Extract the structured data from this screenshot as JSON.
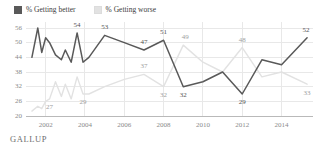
{
  "legend": {
    "items": [
      {
        "label": "% Getting better",
        "color": "#595959",
        "key": "better"
      },
      {
        "label": "% Getting worse",
        "color": "#e2e2e2",
        "key": "worse"
      }
    ]
  },
  "footer": {
    "brand": "GALLUP"
  },
  "chart_data": {
    "type": "line",
    "title": "",
    "xlabel": "",
    "ylabel": "",
    "ylim": [
      20,
      56
    ],
    "xlim": [
      2001.0,
      2015.6
    ],
    "grid": true,
    "legend_position": "top-left",
    "yticks": [
      56,
      50,
      44,
      38,
      32,
      26,
      20
    ],
    "xticks": [
      2002,
      2004,
      2006,
      2008,
      2010,
      2012,
      2014
    ],
    "series": [
      {
        "name": "% Getting better",
        "color": "#595959",
        "x": [
          2001.3,
          2001.6,
          2001.8,
          2002.0,
          2002.2,
          2002.5,
          2002.8,
          2003.0,
          2003.3,
          2003.6,
          2003.9,
          2004.2,
          2005.0,
          2006.0,
          2007.0,
          2008.0,
          2009.0,
          2010.0,
          2011.0,
          2012.0,
          2013.0,
          2014.0,
          2015.3
        ],
        "values": [
          44,
          56,
          46,
          52,
          50,
          45,
          43,
          47,
          42,
          54,
          42,
          44,
          53,
          50,
          47,
          51,
          32,
          34,
          38,
          29,
          43,
          41,
          52
        ]
      },
      {
        "name": "% Getting worse",
        "color": "#e2e2e2",
        "x": [
          2001.3,
          2001.6,
          2001.8,
          2002.0,
          2002.2,
          2002.5,
          2002.8,
          2003.0,
          2003.3,
          2003.6,
          2003.9,
          2004.2,
          2005.0,
          2006.0,
          2007.0,
          2008.0,
          2009.0,
          2010.0,
          2011.0,
          2012.0,
          2013.0,
          2014.0,
          2015.3
        ],
        "values": [
          22,
          24,
          23,
          26,
          27,
          34,
          28,
          33,
          27,
          36,
          29,
          29,
          32,
          35,
          37,
          32,
          49,
          42,
          38,
          48,
          36,
          38,
          33
        ]
      }
    ],
    "point_labels": [
      {
        "series": "better",
        "text": "54",
        "x": 2003.6,
        "y": 54
      },
      {
        "series": "better",
        "text": "53",
        "x": 2005.0,
        "y": 53
      },
      {
        "series": "better",
        "text": "47",
        "x": 2007.0,
        "y": 47
      },
      {
        "series": "better",
        "text": "51",
        "x": 2008.0,
        "y": 51
      },
      {
        "series": "better",
        "text": "32",
        "x": 2009.0,
        "y": 32
      },
      {
        "series": "better",
        "text": "29",
        "x": 2012.0,
        "y": 29
      },
      {
        "series": "better",
        "text": "52",
        "x": 2015.3,
        "y": 52
      },
      {
        "series": "worse",
        "text": "27",
        "x": 2002.2,
        "y": 27
      },
      {
        "series": "worse",
        "text": "29",
        "x": 2003.9,
        "y": 29
      },
      {
        "series": "worse",
        "text": "37",
        "x": 2007.0,
        "y": 37
      },
      {
        "series": "worse",
        "text": "32",
        "x": 2008.0,
        "y": 32
      },
      {
        "series": "worse",
        "text": "49",
        "x": 2009.0,
        "y": 49
      },
      {
        "series": "worse",
        "text": "48",
        "x": 2012.0,
        "y": 48
      },
      {
        "series": "worse",
        "text": "33",
        "x": 2015.3,
        "y": 33
      }
    ]
  }
}
